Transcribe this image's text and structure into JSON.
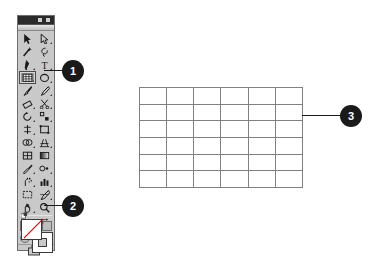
{
  "application": {
    "name": "Adobe Illustrator Toolbox"
  },
  "toolbox": {
    "title_bar": {
      "collapse_widget": "collapse-widget",
      "close_widget": "close-widget"
    },
    "tools": [
      {
        "name": "selection-tool",
        "label": "Selection",
        "selected": false,
        "has_flyout": false
      },
      {
        "name": "direct-selection-tool",
        "label": "Direct Selection",
        "selected": false,
        "has_flyout": true
      },
      {
        "name": "magic-wand-tool",
        "label": "Magic Wand",
        "selected": false,
        "has_flyout": false
      },
      {
        "name": "lasso-tool",
        "label": "Lasso",
        "selected": false,
        "has_flyout": false
      },
      {
        "name": "pen-tool",
        "label": "Pen",
        "selected": false,
        "has_flyout": true
      },
      {
        "name": "type-tool",
        "label": "Type",
        "selected": false,
        "has_flyout": true
      },
      {
        "name": "rectangular-grid-tool",
        "label": "Rectangular Grid",
        "selected": true,
        "has_flyout": true
      },
      {
        "name": "ellipse-tool",
        "label": "Ellipse",
        "selected": false,
        "has_flyout": true
      },
      {
        "name": "paintbrush-tool",
        "label": "Paintbrush",
        "selected": false,
        "has_flyout": false
      },
      {
        "name": "pencil-tool",
        "label": "Pencil",
        "selected": false,
        "has_flyout": true
      },
      {
        "name": "eraser-tool",
        "label": "Eraser",
        "selected": false,
        "has_flyout": true
      },
      {
        "name": "scissors-tool",
        "label": "Scissors",
        "selected": false,
        "has_flyout": true
      },
      {
        "name": "rotate-tool",
        "label": "Rotate",
        "selected": false,
        "has_flyout": true
      },
      {
        "name": "scale-tool",
        "label": "Scale",
        "selected": false,
        "has_flyout": true
      },
      {
        "name": "width-tool",
        "label": "Width",
        "selected": false,
        "has_flyout": true
      },
      {
        "name": "free-transform-tool",
        "label": "Free Transform",
        "selected": false,
        "has_flyout": false
      },
      {
        "name": "shape-builder-tool",
        "label": "Shape Builder",
        "selected": false,
        "has_flyout": true
      },
      {
        "name": "perspective-grid-tool",
        "label": "Perspective Grid",
        "selected": false,
        "has_flyout": true
      },
      {
        "name": "mesh-tool",
        "label": "Mesh",
        "selected": false,
        "has_flyout": false
      },
      {
        "name": "gradient-tool",
        "label": "Gradient",
        "selected": false,
        "has_flyout": false
      },
      {
        "name": "eyedropper-tool",
        "label": "Eyedropper",
        "selected": false,
        "has_flyout": true
      },
      {
        "name": "blend-tool",
        "label": "Blend",
        "selected": false,
        "has_flyout": true
      },
      {
        "name": "symbol-sprayer-tool",
        "label": "Symbol Sprayer",
        "selected": false,
        "has_flyout": true
      },
      {
        "name": "column-graph-tool",
        "label": "Column Graph",
        "selected": false,
        "has_flyout": true
      },
      {
        "name": "artboard-tool",
        "label": "Artboard",
        "selected": false,
        "has_flyout": false
      },
      {
        "name": "slice-tool",
        "label": "Slice",
        "selected": false,
        "has_flyout": true
      },
      {
        "name": "hand-tool",
        "label": "Hand",
        "selected": false,
        "has_flyout": true
      },
      {
        "name": "zoom-tool",
        "label": "Zoom",
        "selected": false,
        "has_flyout": false
      }
    ],
    "color_controls": {
      "fill_swatch": {
        "name": "fill-swatch",
        "value": "None",
        "color": "#ffffff"
      },
      "stroke_swatch": {
        "name": "stroke-swatch",
        "value": "Black",
        "color": "#ffffff"
      },
      "swap_icon": "swap-fill-stroke-icon",
      "default_icon": "default-fill-stroke-icon"
    },
    "paint_mode_buttons": [
      {
        "name": "color-button",
        "label": "Color"
      },
      {
        "name": "gradient-button",
        "label": "Gradient"
      },
      {
        "name": "none-button",
        "label": "None"
      }
    ],
    "drawing_mode_buttons": [
      {
        "name": "draw-normal-button",
        "label": "Draw Normal"
      },
      {
        "name": "draw-behind-button",
        "label": "Draw Behind"
      },
      {
        "name": "draw-inside-button",
        "label": "Draw Inside"
      }
    ],
    "screen_mode_button": {
      "name": "change-screen-mode-button",
      "label": "Change Screen Mode"
    }
  },
  "artwork": {
    "grid": {
      "name": "rectangular-grid-object",
      "columns": 6,
      "rows": 6,
      "stroke_color": "#808080",
      "fill_color": "#ffffff"
    }
  },
  "callouts": [
    {
      "id": "1",
      "number": "1",
      "target": "rectangular-grid-tool"
    },
    {
      "id": "2",
      "number": "2",
      "target": "fill-stroke-controls"
    },
    {
      "id": "3",
      "number": "3",
      "target": "rectangular-grid-object"
    }
  ],
  "chart_data": {
    "type": "table",
    "title": "",
    "columns": 6,
    "rows": 6,
    "categories": [],
    "values": []
  }
}
